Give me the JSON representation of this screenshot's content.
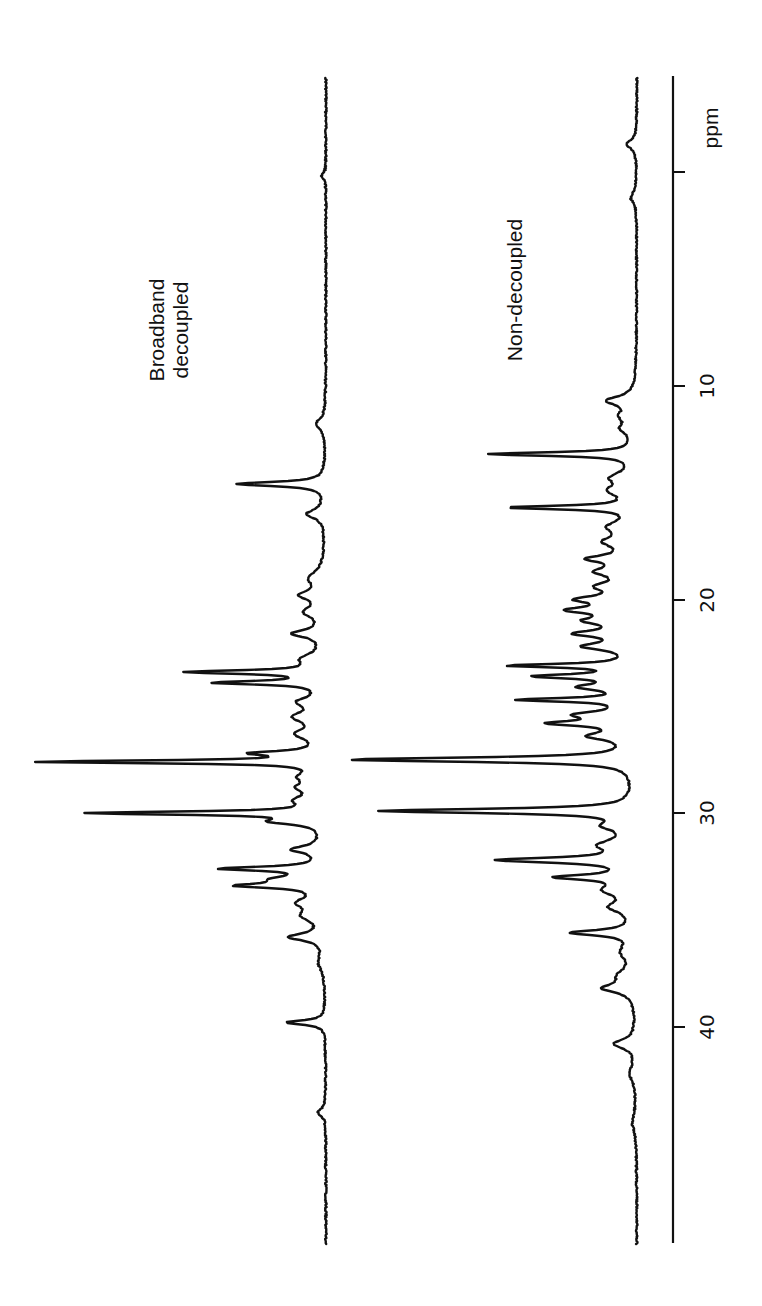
{
  "chart_data": {
    "type": "line",
    "title": "",
    "orientation": "rotated-90",
    "xlabel": "ppm",
    "ylabel": "",
    "xlim": [
      -4.5,
      50
    ],
    "x_ticks": [
      0,
      10,
      20,
      30,
      40
    ],
    "x_tick_labels": [
      "",
      "10",
      "20",
      "30",
      "40"
    ],
    "grid": false,
    "legend": "inline labels",
    "series": [
      {
        "name": "Broadband decoupled",
        "label_lines": [
          "Broadband",
          "decoupled"
        ],
        "baseline_px": 326,
        "peaks": [
          {
            "ppm": 0.2,
            "height": 5,
            "width": 0.15
          },
          {
            "ppm": 11.8,
            "height": 10,
            "width": 0.3
          },
          {
            "ppm": 14.6,
            "height": 88,
            "width": 0.12
          },
          {
            "ppm": 16.0,
            "height": 18,
            "width": 0.25
          },
          {
            "ppm": 19.0,
            "height": 14,
            "width": 0.4
          },
          {
            "ppm": 19.8,
            "height": 22,
            "width": 0.25
          },
          {
            "ppm": 20.6,
            "height": 18,
            "width": 0.3
          },
          {
            "ppm": 21.6,
            "height": 30,
            "width": 0.2
          },
          {
            "ppm": 22.8,
            "height": 20,
            "width": 0.3
          },
          {
            "ppm": 23.4,
            "height": 132,
            "width": 0.1
          },
          {
            "ppm": 23.9,
            "height": 105,
            "width": 0.1
          },
          {
            "ppm": 24.8,
            "height": 22,
            "width": 0.25
          },
          {
            "ppm": 25.5,
            "height": 26,
            "width": 0.3
          },
          {
            "ppm": 26.3,
            "height": 24,
            "width": 0.3
          },
          {
            "ppm": 27.2,
            "height": 64,
            "width": 0.12
          },
          {
            "ppm": 27.6,
            "height": 282,
            "width": 0.08
          },
          {
            "ppm": 28.3,
            "height": 18,
            "width": 0.25
          },
          {
            "ppm": 28.8,
            "height": 20,
            "width": 0.25
          },
          {
            "ppm": 29.4,
            "height": 22,
            "width": 0.25
          },
          {
            "ppm": 30.0,
            "height": 230,
            "width": 0.09
          },
          {
            "ppm": 30.4,
            "height": 45,
            "width": 0.15
          },
          {
            "ppm": 31.7,
            "height": 30,
            "width": 0.2
          },
          {
            "ppm": 32.6,
            "height": 98,
            "width": 0.11
          },
          {
            "ppm": 33.1,
            "height": 40,
            "width": 0.2
          },
          {
            "ppm": 33.4,
            "height": 75,
            "width": 0.12
          },
          {
            "ppm": 34.2,
            "height": 22,
            "width": 0.3
          },
          {
            "ppm": 34.8,
            "height": 18,
            "width": 0.3
          },
          {
            "ppm": 35.8,
            "height": 34,
            "width": 0.2
          },
          {
            "ppm": 37.0,
            "height": 6,
            "width": 0.4
          },
          {
            "ppm": 39.8,
            "height": 40,
            "width": 0.12
          },
          {
            "ppm": 44.0,
            "height": 8,
            "width": 0.2
          }
        ]
      },
      {
        "name": "Non-decoupled",
        "label_lines": [
          "Non-decoupled"
        ],
        "baseline_px": 637,
        "peaks": [
          {
            "ppm": -1.3,
            "height": 10,
            "width": 0.25
          },
          {
            "ppm": 1.2,
            "height": 6,
            "width": 0.3
          },
          {
            "ppm": 10.7,
            "height": 28,
            "width": 0.25
          },
          {
            "ppm": 11.4,
            "height": 12,
            "width": 0.3
          },
          {
            "ppm": 12.0,
            "height": 12,
            "width": 0.3
          },
          {
            "ppm": 13.2,
            "height": 145,
            "width": 0.1
          },
          {
            "ppm": 14.3,
            "height": 20,
            "width": 0.3
          },
          {
            "ppm": 14.9,
            "height": 22,
            "width": 0.3
          },
          {
            "ppm": 15.7,
            "height": 124,
            "width": 0.1
          },
          {
            "ppm": 16.6,
            "height": 22,
            "width": 0.3
          },
          {
            "ppm": 17.3,
            "height": 26,
            "width": 0.3
          },
          {
            "ppm": 18.1,
            "height": 40,
            "width": 0.2
          },
          {
            "ppm": 18.7,
            "height": 32,
            "width": 0.25
          },
          {
            "ppm": 19.4,
            "height": 30,
            "width": 0.25
          },
          {
            "ppm": 20.0,
            "height": 48,
            "width": 0.2
          },
          {
            "ppm": 20.5,
            "height": 56,
            "width": 0.18
          },
          {
            "ppm": 21.0,
            "height": 40,
            "width": 0.2
          },
          {
            "ppm": 21.6,
            "height": 52,
            "width": 0.18
          },
          {
            "ppm": 22.2,
            "height": 46,
            "width": 0.2
          },
          {
            "ppm": 23.1,
            "height": 120,
            "width": 0.1
          },
          {
            "ppm": 23.6,
            "height": 92,
            "width": 0.12
          },
          {
            "ppm": 24.1,
            "height": 48,
            "width": 0.18
          },
          {
            "ppm": 24.7,
            "height": 110,
            "width": 0.1
          },
          {
            "ppm": 25.4,
            "height": 50,
            "width": 0.2
          },
          {
            "ppm": 25.8,
            "height": 74,
            "width": 0.14
          },
          {
            "ppm": 26.4,
            "height": 40,
            "width": 0.22
          },
          {
            "ppm": 27.5,
            "height": 285,
            "width": 0.12
          },
          {
            "ppm": 29.9,
            "height": 252,
            "width": 0.12
          },
          {
            "ppm": 30.6,
            "height": 24,
            "width": 0.25
          },
          {
            "ppm": 31.5,
            "height": 30,
            "width": 0.3
          },
          {
            "ppm": 32.2,
            "height": 132,
            "width": 0.14
          },
          {
            "ppm": 33.0,
            "height": 72,
            "width": 0.14
          },
          {
            "ppm": 33.6,
            "height": 26,
            "width": 0.3
          },
          {
            "ppm": 34.4,
            "height": 22,
            "width": 0.3
          },
          {
            "ppm": 35.6,
            "height": 62,
            "width": 0.15
          },
          {
            "ppm": 36.5,
            "height": 12,
            "width": 0.4
          },
          {
            "ppm": 37.6,
            "height": 14,
            "width": 0.35
          },
          {
            "ppm": 38.2,
            "height": 30,
            "width": 0.25
          },
          {
            "ppm": 40.8,
            "height": 22,
            "width": 0.25
          },
          {
            "ppm": 42.2,
            "height": 6,
            "width": 0.4
          },
          {
            "ppm": 44.5,
            "height": 4,
            "width": 0.5
          }
        ]
      }
    ],
    "annotations": [
      "Broadband decoupled",
      "Non-decoupled"
    ]
  },
  "layout": {
    "ppm_zero_px": 172,
    "px_per_ppm": 21.37,
    "axis_x_px": 673,
    "axis_top_px": 76,
    "axis_bottom_px": 1243,
    "trace_top_px": 78,
    "trace_bottom_px": 1244
  },
  "labels": {
    "axis_unit": "ppm",
    "broadband_line1": "Broadband",
    "broadband_line2": "decoupled",
    "nondecoupled": "Non-decoupled",
    "tick_10": "10",
    "tick_20": "20",
    "tick_30": "30",
    "tick_40": "40"
  }
}
